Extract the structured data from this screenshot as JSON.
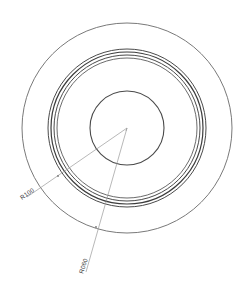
{
  "drawing": {
    "title": "Concentric Circle Section View",
    "type": "cad-technical-drawing",
    "background_color": "#ffffff",
    "line_color": "#555555",
    "heavy_line_color": "#3c3c3c",
    "leader_color": "#9a9a9a",
    "text_color": "#3a3a3a",
    "canvas": {
      "width": 239,
      "height": 291
    },
    "center": {
      "x": 127,
      "y": 128
    }
  },
  "circles": [
    {
      "name": "outer-boundary-circle",
      "radius": 105,
      "stroke_width": 0.9,
      "color": "#6a6a6a"
    },
    {
      "name": "ring-outer-circle",
      "radius": 79,
      "stroke_width": 1.0,
      "color": "#4a4a4a"
    },
    {
      "name": "ring-mid-outer-circle",
      "radius": 76,
      "stroke_width": 1.2,
      "color": "#3c3c3c"
    },
    {
      "name": "ring-mid-inner-circle",
      "radius": 73,
      "stroke_width": 1.0,
      "color": "#4a4a4a"
    },
    {
      "name": "ring-inner-circle",
      "radius": 70,
      "stroke_width": 0.9,
      "color": "#5a5a5a"
    },
    {
      "name": "hub-circle",
      "radius": 37,
      "stroke_width": 1.1,
      "color": "#4a4a4a"
    }
  ],
  "dimensions": [
    {
      "id": "radius-dimension-1",
      "label": "R100",
      "leader_start": {
        "x": 127,
        "y": 128
      },
      "leader_end": {
        "x": 27,
        "y": 197
      },
      "text_position": {
        "x": 22,
        "y": 200
      },
      "text_rotation": -35,
      "arrow_at": {
        "x": 58,
        "y": 176
      }
    },
    {
      "id": "radius-dimension-2",
      "label": "R060",
      "leader_start": {
        "x": 127,
        "y": 128
      },
      "leader_end": {
        "x": 86,
        "y": 272
      },
      "text_position": {
        "x": 83,
        "y": 274
      },
      "text_rotation": -72,
      "arrow_at": {
        "x": 96,
        "y": 227
      }
    }
  ]
}
